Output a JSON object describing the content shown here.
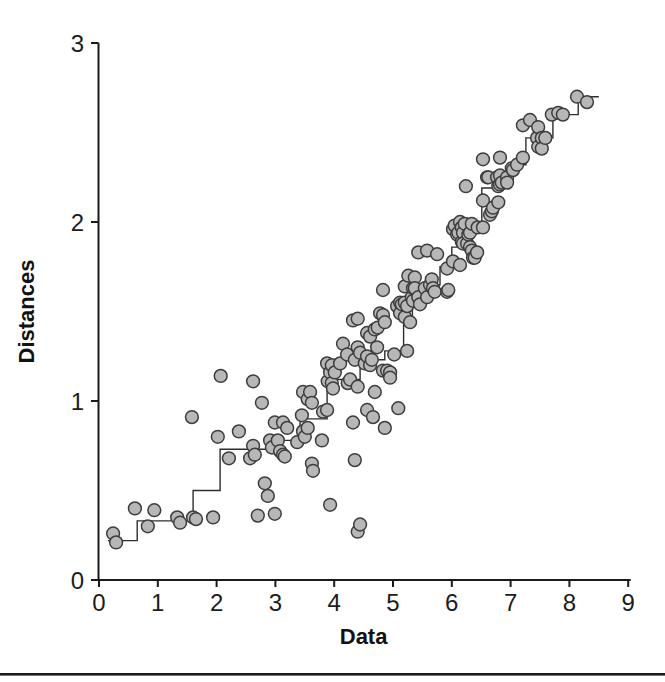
{
  "figure": {
    "background": "#ffffff",
    "divider_color": "#1b1b1b",
    "axis_color": "#1a1a1a",
    "text_color": "#141414"
  },
  "chart_data": {
    "type": "scatter",
    "title": "",
    "xlabel": "Data",
    "ylabel": "Distances",
    "xlim": [
      0,
      9
    ],
    "ylim": [
      0,
      3
    ],
    "x_ticks": [
      0,
      1,
      2,
      3,
      4,
      5,
      6,
      7,
      8,
      9
    ],
    "y_ticks": [
      0,
      1,
      2,
      3
    ],
    "grid": false,
    "legend": "none",
    "marker": {
      "shape": "circle",
      "fill": "#b7b7b7",
      "stroke": "#3d3d3d",
      "radius_px": 6.4,
      "stroke_width": 1.5
    },
    "step_line": {
      "color": "#2e2e2e",
      "width_px": 1.4,
      "end_x": 8.5,
      "breakpoints": [
        [
          0.15,
          0.22
        ],
        [
          0.65,
          0.33
        ],
        [
          1.6,
          0.5
        ],
        [
          2.06,
          0.73
        ],
        [
          2.95,
          0.78
        ],
        [
          3.42,
          0.9
        ],
        [
          3.88,
          1.07
        ],
        [
          4.01,
          1.12
        ],
        [
          4.44,
          1.23
        ],
        [
          4.86,
          1.28
        ],
        [
          5.18,
          1.46
        ],
        [
          5.33,
          1.56
        ],
        [
          5.5,
          1.65
        ],
        [
          5.8,
          1.75
        ],
        [
          6.0,
          1.86
        ],
        [
          6.09,
          1.98
        ],
        [
          6.51,
          2.19
        ],
        [
          6.96,
          2.32
        ],
        [
          7.26,
          2.47
        ],
        [
          7.72,
          2.6
        ],
        [
          8.15,
          2.7
        ]
      ]
    },
    "points": [
      [
        0.24,
        0.26
      ],
      [
        0.29,
        0.21
      ],
      [
        0.61,
        0.4
      ],
      [
        0.83,
        0.3
      ],
      [
        0.94,
        0.39
      ],
      [
        1.33,
        0.35
      ],
      [
        1.38,
        0.32
      ],
      [
        1.58,
        0.91
      ],
      [
        1.6,
        0.35
      ],
      [
        1.65,
        0.34
      ],
      [
        1.94,
        0.35
      ],
      [
        2.02,
        0.8
      ],
      [
        2.07,
        1.14
      ],
      [
        2.21,
        0.68
      ],
      [
        2.38,
        0.83
      ],
      [
        2.57,
        0.68
      ],
      [
        2.62,
        0.75
      ],
      [
        2.62,
        1.11
      ],
      [
        2.65,
        0.7
      ],
      [
        2.7,
        0.36
      ],
      [
        2.77,
        0.99
      ],
      [
        2.82,
        0.54
      ],
      [
        2.87,
        0.47
      ],
      [
        2.91,
        0.78
      ],
      [
        2.94,
        0.74
      ],
      [
        2.99,
        0.88
      ],
      [
        2.99,
        0.37
      ],
      [
        3.04,
        0.78
      ],
      [
        3.08,
        0.72
      ],
      [
        3.13,
        0.88
      ],
      [
        3.13,
        0.7
      ],
      [
        3.16,
        0.69
      ],
      [
        3.2,
        0.85
      ],
      [
        3.37,
        0.77
      ],
      [
        3.45,
        0.92
      ],
      [
        3.47,
        1.05
      ],
      [
        3.47,
        0.83
      ],
      [
        3.5,
        0.8
      ],
      [
        3.55,
        1.01
      ],
      [
        3.55,
        0.85
      ],
      [
        3.59,
        1.05
      ],
      [
        3.62,
        0.99
      ],
      [
        3.62,
        0.65
      ],
      [
        3.64,
        0.61
      ],
      [
        3.79,
        0.78
      ],
      [
        3.81,
        0.94
      ],
      [
        3.88,
        1.21
      ],
      [
        3.88,
        0.95
      ],
      [
        3.89,
        1.11
      ],
      [
        3.93,
        1.16
      ],
      [
        3.93,
        0.42
      ],
      [
        3.96,
        1.2
      ],
      [
        3.96,
        1.1
      ],
      [
        3.98,
        1.07
      ],
      [
        4.01,
        1.16
      ],
      [
        4.1,
        1.21
      ],
      [
        4.15,
        1.32
      ],
      [
        4.22,
        1.26
      ],
      [
        4.23,
        1.1
      ],
      [
        4.27,
        1.12
      ],
      [
        4.32,
        1.45
      ],
      [
        4.32,
        0.88
      ],
      [
        4.35,
        1.23
      ],
      [
        4.35,
        0.67
      ],
      [
        4.4,
        1.46
      ],
      [
        4.4,
        1.3
      ],
      [
        4.4,
        1.08
      ],
      [
        4.4,
        0.27
      ],
      [
        4.44,
        1.27
      ],
      [
        4.44,
        0.31
      ],
      [
        4.52,
        1.21
      ],
      [
        4.56,
        1.38
      ],
      [
        4.56,
        1.25
      ],
      [
        4.56,
        0.95
      ],
      [
        4.61,
        1.36
      ],
      [
        4.61,
        1.2
      ],
      [
        4.64,
        1.23
      ],
      [
        4.66,
        0.91
      ],
      [
        4.69,
        1.4
      ],
      [
        4.69,
        1.05
      ],
      [
        4.73,
        1.3
      ],
      [
        4.74,
        1.41
      ],
      [
        4.78,
        1.49
      ],
      [
        4.83,
        1.62
      ],
      [
        4.83,
        1.48
      ],
      [
        4.83,
        1.17
      ],
      [
        4.86,
        1.44
      ],
      [
        4.86,
        0.85
      ],
      [
        4.9,
        1.17
      ],
      [
        4.95,
        1.16
      ],
      [
        4.95,
        1.13
      ],
      [
        5.02,
        1.26
      ],
      [
        5.07,
        1.53
      ],
      [
        5.09,
        0.96
      ],
      [
        5.12,
        1.49
      ],
      [
        5.12,
        1.55
      ],
      [
        5.15,
        1.54
      ],
      [
        5.2,
        1.64
      ],
      [
        5.2,
        1.55
      ],
      [
        5.2,
        1.47
      ],
      [
        5.24,
        1.53
      ],
      [
        5.24,
        1.28
      ],
      [
        5.26,
        1.7
      ],
      [
        5.29,
        1.44
      ],
      [
        5.32,
        1.58
      ],
      [
        5.34,
        1.63
      ],
      [
        5.34,
        1.56
      ],
      [
        5.37,
        1.69
      ],
      [
        5.37,
        1.63
      ],
      [
        5.43,
        1.83
      ],
      [
        5.43,
        1.58
      ],
      [
        5.46,
        1.54
      ],
      [
        5.54,
        1.63
      ],
      [
        5.58,
        1.84
      ],
      [
        5.58,
        1.58
      ],
      [
        5.63,
        1.65
      ],
      [
        5.66,
        1.68
      ],
      [
        5.68,
        1.63
      ],
      [
        5.71,
        1.61
      ],
      [
        5.75,
        1.82
      ],
      [
        5.92,
        1.74
      ],
      [
        5.92,
        1.61
      ],
      [
        5.94,
        1.62
      ],
      [
        6.02,
        1.96
      ],
      [
        6.02,
        1.78
      ],
      [
        6.05,
        1.98
      ],
      [
        6.09,
        1.93
      ],
      [
        6.11,
        1.94
      ],
      [
        6.14,
        2.0
      ],
      [
        6.14,
        1.76
      ],
      [
        6.17,
        1.97
      ],
      [
        6.17,
        1.89
      ],
      [
        6.19,
        1.94
      ],
      [
        6.19,
        1.88
      ],
      [
        6.22,
        1.99
      ],
      [
        6.24,
        2.2
      ],
      [
        6.26,
        1.88
      ],
      [
        6.28,
        1.93
      ],
      [
        6.31,
        1.94
      ],
      [
        6.31,
        1.86
      ],
      [
        6.34,
        1.99
      ],
      [
        6.34,
        1.84
      ],
      [
        6.36,
        1.8
      ],
      [
        6.39,
        1.8
      ],
      [
        6.43,
        1.83
      ],
      [
        6.44,
        1.97
      ],
      [
        6.53,
        2.35
      ],
      [
        6.53,
        2.12
      ],
      [
        6.53,
        1.97
      ],
      [
        6.6,
        2.25
      ],
      [
        6.62,
        2.25
      ],
      [
        6.65,
        2.04
      ],
      [
        6.68,
        2.06
      ],
      [
        6.7,
        2.08
      ],
      [
        6.77,
        2.25
      ],
      [
        6.79,
        2.2
      ],
      [
        6.79,
        2.11
      ],
      [
        6.82,
        2.36
      ],
      [
        6.82,
        2.26
      ],
      [
        6.82,
        2.21
      ],
      [
        6.85,
        2.22
      ],
      [
        6.94,
        2.25
      ],
      [
        6.94,
        2.22
      ],
      [
        7.02,
        2.3
      ],
      [
        7.04,
        2.29
      ],
      [
        7.11,
        2.32
      ],
      [
        7.21,
        2.54
      ],
      [
        7.21,
        2.36
      ],
      [
        7.33,
        2.57
      ],
      [
        7.45,
        2.47
      ],
      [
        7.47,
        2.53
      ],
      [
        7.47,
        2.42
      ],
      [
        7.53,
        2.47
      ],
      [
        7.53,
        2.41
      ],
      [
        7.59,
        2.47
      ],
      [
        7.7,
        2.6
      ],
      [
        7.81,
        2.61
      ],
      [
        7.89,
        2.6
      ],
      [
        8.13,
        2.7
      ],
      [
        8.3,
        2.67
      ]
    ]
  }
}
